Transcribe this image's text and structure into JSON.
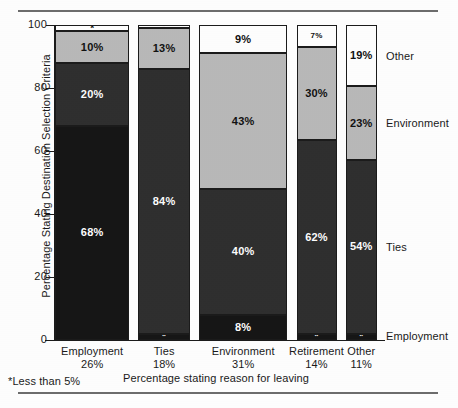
{
  "chart_data": {
    "type": "bar",
    "subtype": "stacked-bar-100-percent-variable-width",
    "title": "",
    "xlabel": "Percentage stating reason for leaving",
    "ylabel": "Percentage Stating Destination Selection Criteria",
    "ylim": [
      0,
      100
    ],
    "yticks": [
      0,
      20,
      40,
      60,
      80,
      100
    ],
    "ytick_labels": [
      "0",
      "20",
      "40",
      "60",
      "80",
      "100"
    ],
    "grid": false,
    "legend_position": "right-outside",
    "categories": [
      "Employment",
      "Ties",
      "Environment",
      "Retirement",
      "Other"
    ],
    "category_sublabels": [
      "26%",
      "18%",
      "31%",
      "14%",
      "11%"
    ],
    "category_widths": [
      26,
      18,
      31,
      14,
      11
    ],
    "series": [
      {
        "name": "Employment",
        "color": "#161616",
        "values": [
          68,
          2,
          8,
          2,
          2
        ],
        "labels": [
          "68%",
          "*",
          "8%",
          "*",
          "*"
        ]
      },
      {
        "name": "Ties",
        "color": "#2f2f2f",
        "values": [
          20,
          84,
          40,
          62,
          54
        ],
        "labels": [
          "20%",
          "84%",
          "40%",
          "62%",
          "54%"
        ]
      },
      {
        "name": "Environment",
        "color": "#b9b9b9",
        "values": [
          10,
          13,
          43,
          30,
          23
        ],
        "labels": [
          "10%",
          "13%",
          "43%",
          "30%",
          "23%"
        ]
      },
      {
        "name": "Other",
        "color": "#ffffff",
        "values": [
          2,
          1,
          9,
          7,
          19
        ],
        "labels": [
          "*",
          "*",
          "9%",
          "7%",
          "19%"
        ]
      }
    ],
    "series_labels_right": [
      "Other",
      "Environment",
      "Ties",
      "Employment"
    ],
    "annotations": [
      "*Less than 5%"
    ]
  },
  "axes": {
    "y_title": "Percentage Stating Destination Selection Criteria",
    "x_title": "Percentage stating reason for leaving",
    "y_ticks": [
      {
        "value": 100,
        "label": "100"
      },
      {
        "value": 80,
        "label": "80"
      },
      {
        "value": 60,
        "label": "60"
      },
      {
        "value": 40,
        "label": "40"
      },
      {
        "value": 20,
        "label": "20"
      },
      {
        "value": 0,
        "label": "0"
      }
    ]
  },
  "bars": [
    {
      "name": "Employment",
      "sublabel": "26%",
      "segments": [
        {
          "series": "Other",
          "value": 2,
          "label": "*",
          "tone": "light"
        },
        {
          "series": "Environment",
          "value": 10,
          "label": "10%",
          "tone": "light"
        },
        {
          "series": "Ties",
          "value": 20,
          "label": "20%",
          "tone": "dark"
        },
        {
          "series": "Employment",
          "value": 68,
          "label": "68%",
          "tone": "dark"
        }
      ]
    },
    {
      "name": "Ties",
      "sublabel": "18%",
      "segments": [
        {
          "series": "Other",
          "value": 1,
          "label": "*",
          "tone": "light"
        },
        {
          "series": "Environment",
          "value": 13,
          "label": "13%",
          "tone": "light"
        },
        {
          "series": "Ties",
          "value": 84,
          "label": "84%",
          "tone": "dark"
        },
        {
          "series": "Employment",
          "value": 2,
          "label": "*",
          "tone": "dark"
        }
      ]
    },
    {
      "name": "Environment",
      "sublabel": "31%",
      "segments": [
        {
          "series": "Other",
          "value": 9,
          "label": "9%",
          "tone": "light"
        },
        {
          "series": "Environment",
          "value": 43,
          "label": "43%",
          "tone": "light"
        },
        {
          "series": "Ties",
          "value": 40,
          "label": "40%",
          "tone": "dark"
        },
        {
          "series": "Employment",
          "value": 8,
          "label": "8%",
          "tone": "dark"
        }
      ]
    },
    {
      "name": "Retirement",
      "sublabel": "14%",
      "segments": [
        {
          "series": "Other",
          "value": 7,
          "label": "7%",
          "tone": "light"
        },
        {
          "series": "Environment",
          "value": 30,
          "label": "30%",
          "tone": "light"
        },
        {
          "series": "Ties",
          "value": 62,
          "label": "62%",
          "tone": "dark"
        },
        {
          "series": "Employment",
          "value": 2,
          "label": "*",
          "tone": "dark"
        }
      ]
    },
    {
      "name": "Other",
      "sublabel": "11%",
      "segments": [
        {
          "series": "Other",
          "value": 19,
          "label": "19%",
          "tone": "light"
        },
        {
          "series": "Environment",
          "value": 23,
          "label": "23%",
          "tone": "light"
        },
        {
          "series": "Ties",
          "value": 54,
          "label": "54%",
          "tone": "dark"
        },
        {
          "series": "Employment",
          "value": 2,
          "label": "*",
          "tone": "dark"
        }
      ]
    }
  ],
  "right_labels": [
    {
      "text": "Other"
    },
    {
      "text": "Environment"
    },
    {
      "text": "Ties"
    },
    {
      "text": "Employment"
    }
  ],
  "footnote": "*Less than 5%",
  "colors": {
    "employment": "#161616",
    "ties": "#2f2f2f",
    "environment": "#b9b9b9",
    "other": "#ffffff",
    "outline": "#1b1b1b",
    "rule": "#6d6d6d"
  }
}
